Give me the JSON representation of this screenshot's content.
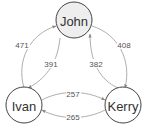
{
  "diagram": {
    "type": "directed-graph",
    "nodes": [
      {
        "id": "john",
        "label": "John",
        "fill": "#eeeeee"
      },
      {
        "id": "ivan",
        "label": "Ivan",
        "fill": "#ffffff"
      },
      {
        "id": "kerry",
        "label": "Kerry",
        "fill": "#ffffff"
      }
    ],
    "edges": [
      {
        "from": "Ivan",
        "to": "John",
        "label": "471"
      },
      {
        "from": "John",
        "to": "Ivan",
        "label": "391"
      },
      {
        "from": "John",
        "to": "Kerry",
        "label": "408"
      },
      {
        "from": "Kerry",
        "to": "John",
        "label": "382"
      },
      {
        "from": "Ivan",
        "to": "Kerry",
        "label": "257"
      },
      {
        "from": "Kerry",
        "to": "Ivan",
        "label": "265"
      }
    ]
  }
}
